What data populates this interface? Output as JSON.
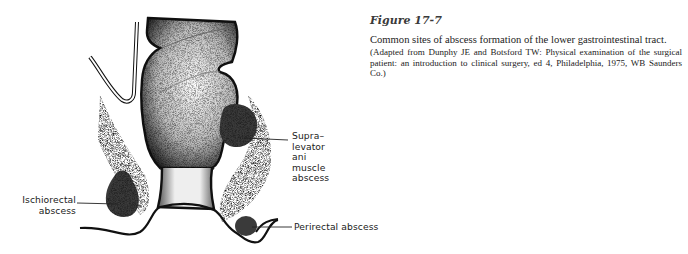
{
  "figure": {
    "title": "Figure 17-7",
    "description": "Common sites of abscess formation of the lower gastrointestinal tract.",
    "source": "(Adapted from Dunphy JE and Botsford TW: Physical examination of the surgical patient: an introduction to clinical surgery, ed 4, Philadelphia, 1975, WB Saunders Co.)"
  },
  "illustration": {
    "subject": "Anorectal cross-section with abscess sites",
    "labels": {
      "supra_levator_line1": "Supra–levator ani",
      "supra_levator_line2": "muscle abscess",
      "ischiorectal_line1": "Ischiorectal",
      "ischiorectal_line2": "abscess",
      "perirectal": "Perirectal abscess"
    }
  }
}
